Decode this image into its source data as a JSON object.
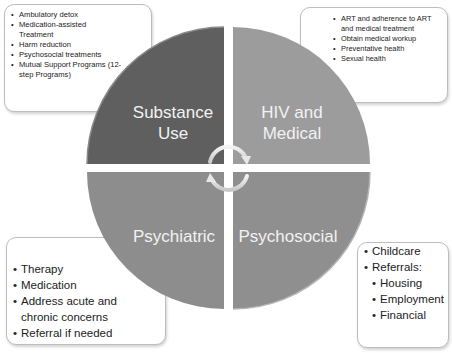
{
  "diagram": {
    "quadrants": [
      {
        "id": "substance-use",
        "label_line1": "Substance",
        "label_line2": "Use",
        "color": "#5f5f5f"
      },
      {
        "id": "hiv-medical",
        "label_line1": "HIV and",
        "label_line2": "Medical",
        "color": "#9c9c9c"
      },
      {
        "id": "psychiatric",
        "label_line1": "Psychiatric",
        "label_line2": "",
        "color": "#8d8d8d"
      },
      {
        "id": "psychosocial",
        "label_line1": "Psychosocial",
        "label_line2": "",
        "color": "#8f8f8f"
      }
    ],
    "boxes": {
      "substance_use": {
        "items": [
          "Ambulatory detox",
          "Medication-assisted Treatment",
          "Harm reduction",
          "Psychosocial treatments",
          "Mutual Support Programs (12-step Programs)"
        ]
      },
      "hiv_medical": {
        "items": [
          "ART and adherence to ART and medical treatment",
          "Obtain medical workup",
          "Preventative health",
          "Sexual health"
        ]
      },
      "psychiatric": {
        "items": [
          "Therapy",
          "Medication",
          "Address acute and chronic concerns",
          "Referral if needed"
        ]
      },
      "psychosocial": {
        "items": [
          "Childcare",
          "Referrals:"
        ],
        "subitems": [
          "Housing",
          "Employment",
          "Financial"
        ]
      }
    },
    "center_arrows": [
      "clockwise-arc-arrow-top",
      "clockwise-arc-arrow-bottom"
    ]
  }
}
